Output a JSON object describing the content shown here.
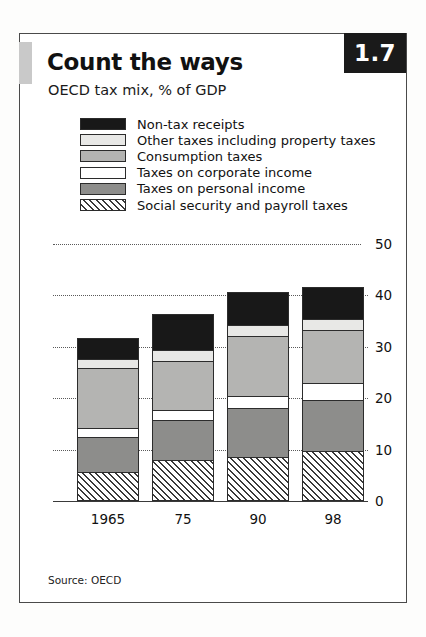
{
  "figure": {
    "number_badge": "1.7",
    "title": "Count the ways",
    "subtitle": "OECD tax mix, % of GDP",
    "source": "Source: OECD"
  },
  "colors": {
    "non_tax_receipts": "#181818",
    "other_taxes": "#e8e8e6",
    "consumption_taxes": "#b4b4b2",
    "corporate_income": "#ffffff",
    "personal_income": "#8d8d8b",
    "social_security": "#ffffff",
    "frame": "#4a4a4a",
    "badge_background": "#1a1a1a",
    "badge_text": "#ffffff",
    "gridline": "#5a5a5a"
  },
  "chart_data": {
    "type": "bar",
    "stacked": true,
    "title": "Count the ways",
    "subtitle": "OECD tax mix, % of GDP",
    "xlabel": "",
    "ylabel": "% of GDP",
    "categories": [
      "1965",
      "75",
      "90",
      "98"
    ],
    "ylim": [
      0,
      50
    ],
    "yticks": [
      0,
      10,
      20,
      30,
      40,
      50
    ],
    "ytick_labels": [
      "0",
      "10",
      "20",
      "30",
      "40",
      "50"
    ],
    "grid": "horizontal-dotted",
    "legend_position": "above-plot",
    "series": [
      {
        "name": "Social security and payroll taxes",
        "swatch": "hatched-diagonal",
        "values": [
          5.6,
          7.9,
          8.5,
          9.7
        ]
      },
      {
        "name": "Taxes on personal income",
        "swatch": "dark-gray",
        "values": [
          6.9,
          7.9,
          9.5,
          9.9
        ]
      },
      {
        "name": "Taxes on corporate income",
        "swatch": "white",
        "values": [
          1.8,
          2.0,
          2.4,
          3.4
        ]
      },
      {
        "name": "Consumption taxes",
        "swatch": "mid-gray",
        "values": [
          11.5,
          9.5,
          11.7,
          10.3
        ]
      },
      {
        "name": "Other taxes including property taxes",
        "swatch": "light-gray",
        "values": [
          1.8,
          2.0,
          2.2,
          2.2
        ]
      },
      {
        "name": "Non-tax receipts",
        "swatch": "black",
        "values": [
          4.1,
          7.1,
          6.3,
          6.2
        ]
      }
    ],
    "totals": [
      31.7,
      36.4,
      40.6,
      41.7
    ]
  },
  "legend": {
    "items": [
      {
        "label": "Non-tax receipts"
      },
      {
        "label": "Other taxes including property taxes"
      },
      {
        "label": "Consumption taxes"
      },
      {
        "label": "Taxes on corporate income"
      },
      {
        "label": "Taxes on personal income"
      },
      {
        "label": "Social security and payroll taxes"
      }
    ]
  }
}
